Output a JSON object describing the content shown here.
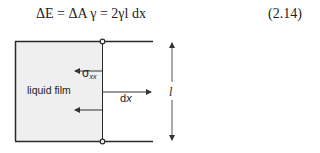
{
  "equation": {
    "text": "ΔE = ΔA γ = 2γl dx",
    "number": "(2.14)"
  },
  "diagram": {
    "film_label": "liquid film",
    "stress_symbol": "σ",
    "stress_subscript": "xx",
    "displacement_label_prefix": "d",
    "displacement_label_var": "x",
    "length_label": "l",
    "colors": {
      "film_fill": "#efefef",
      "line": "#2a2a2a",
      "arrow": "#333333"
    }
  }
}
